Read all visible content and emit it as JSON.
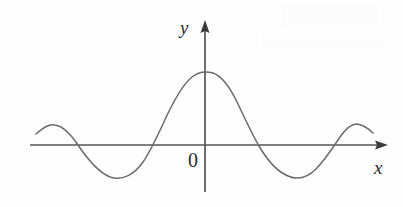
{
  "figure": {
    "background_color": "#fefefe",
    "axis_color": "#555555",
    "curve_color": "#6b6b6b",
    "label_color": "#2b2b2b",
    "width": 403,
    "height": 207
  },
  "labels": {
    "y_axis": "y",
    "x_axis": "x",
    "origin": "0"
  },
  "chart_data": {
    "type": "line",
    "title": "",
    "subtitle": "",
    "xlabel": "x",
    "ylabel": "y",
    "origin_label": "0",
    "grid": false,
    "legend": "none",
    "axis_style": "arrow-terminated cartesian axes, no tick marks",
    "symmetry": "even (symmetric about the y-axis)",
    "xlim": [
      -4.1,
      4.1
    ],
    "ylim": [
      -1.0,
      1.45
    ],
    "axis_pixel_geometry": {
      "x_axis_y_px": 145,
      "y_axis_x_px": 205,
      "x_axis_start_px": 30,
      "x_axis_arrow_tip_px": 388,
      "y_axis_arrow_tip_px": 20,
      "y_axis_bottom_px": 192
    },
    "features": [
      {
        "name": "left curve start",
        "x": -3.65,
        "y": 0.22,
        "px": [
          36,
          134
        ]
      },
      {
        "name": "left outer crest",
        "x": -3.2,
        "y": 0.4,
        "px": [
          55,
          125
        ]
      },
      {
        "name": "zero crossing",
        "x": -2.7,
        "y": 0.0,
        "px": [
          78,
          145
        ]
      },
      {
        "name": "left trough",
        "x": -1.9,
        "y": -0.66,
        "px": [
          117,
          178
        ]
      },
      {
        "name": "zero crossing",
        "x": -1.15,
        "y": 0.0,
        "px": [
          152,
          145
        ]
      },
      {
        "name": "central maximum",
        "x": 0.0,
        "y": 1.4,
        "px": [
          206,
          72
        ]
      },
      {
        "name": "zero crossing",
        "x": 1.1,
        "y": 0.0,
        "px": [
          256,
          145
        ]
      },
      {
        "name": "right trough",
        "x": 1.95,
        "y": -0.66,
        "px": [
          297,
          178
        ]
      },
      {
        "name": "zero crossing",
        "x": 2.7,
        "y": 0.0,
        "px": [
          331,
          145
        ]
      },
      {
        "name": "right outer crest",
        "x": 3.25,
        "y": 0.42,
        "px": [
          356,
          124
        ]
      },
      {
        "name": "right curve end",
        "x": 3.6,
        "y": 0.26,
        "px": [
          373,
          133
        ]
      }
    ],
    "x": [
      -3.65,
      -3.2,
      -2.7,
      -1.9,
      -1.15,
      0.0,
      1.1,
      1.95,
      2.7,
      3.25,
      3.6
    ],
    "values": [
      0.22,
      0.4,
      0.0,
      -0.66,
      0.0,
      1.4,
      0.0,
      -0.66,
      0.0,
      0.42,
      0.26
    ],
    "series": [
      {
        "name": "damped cosine",
        "x": [
          -3.65,
          -3.2,
          -2.7,
          -1.9,
          -1.15,
          0.0,
          1.1,
          1.95,
          2.7,
          3.25,
          3.6
        ],
        "values": [
          0.22,
          0.4,
          0.0,
          -0.66,
          0.0,
          1.4,
          0.0,
          -0.66,
          0.0,
          0.42,
          0.26
        ]
      }
    ],
    "path_px": "M36,134 C44,127 49,124 55,125 C62,126 70,133 78,145 C88,160 98,172 110,177 C122,181 134,175 143,162 C150,152 156,139 163,124 C172,104 182,85 192,77 C198,72 206,71 213,73 C222,76 230,87 238,104 C246,121 252,134 259,146 C266,158 276,171 288,176 C297,180 307,178 316,169 C325,160 332,149 340,137 C347,127 352,124 357,124 C363,125 368,128 373,133"
  }
}
